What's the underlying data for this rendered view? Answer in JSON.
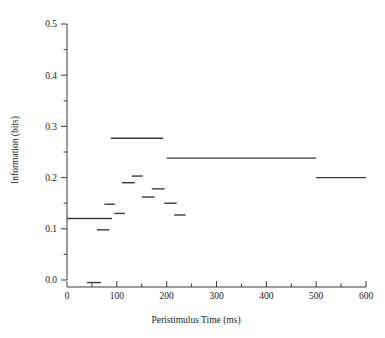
{
  "chart_data": {
    "type": "line",
    "title": "",
    "xlabel": "Peristimulus Time (ms)",
    "ylabel": "Information (bits)",
    "xlim": [
      0,
      600
    ],
    "ylim": [
      0.0,
      0.5
    ],
    "xticks": [
      0,
      100,
      200,
      300,
      400,
      500,
      600
    ],
    "xtick_labels": [
      "0",
      "100",
      "200",
      "300",
      "400",
      "500",
      "600"
    ],
    "xminor_step": 50,
    "yticks": [
      0.0,
      0.1,
      0.2,
      0.3,
      0.4,
      0.5
    ],
    "ytick_labels": [
      "0.0",
      "0.1",
      "0.2",
      "0.3",
      "0.4",
      "0.5"
    ],
    "yminor_step": 0.05,
    "grid": false,
    "legend": null,
    "style": "horizontal-bar-segments",
    "series": [
      {
        "name": "Information",
        "segments": [
          {
            "x_start": 0,
            "x_end": 90,
            "value": 0.12
          },
          {
            "x_start": 40,
            "x_end": 68,
            "value": -0.005
          },
          {
            "x_start": 60,
            "x_end": 85,
            "value": 0.098
          },
          {
            "x_start": 75,
            "x_end": 96,
            "value": 0.148
          },
          {
            "x_start": 88,
            "x_end": 193,
            "value": 0.277
          },
          {
            "x_start": 95,
            "x_end": 116,
            "value": 0.13
          },
          {
            "x_start": 110,
            "x_end": 136,
            "value": 0.19
          },
          {
            "x_start": 130,
            "x_end": 152,
            "value": 0.203
          },
          {
            "x_start": 150,
            "x_end": 176,
            "value": 0.162
          },
          {
            "x_start": 170,
            "x_end": 196,
            "value": 0.178
          },
          {
            "x_start": 195,
            "x_end": 220,
            "value": 0.15
          },
          {
            "x_start": 215,
            "x_end": 238,
            "value": 0.127
          },
          {
            "x_start": 200,
            "x_end": 500,
            "value": 0.238
          },
          {
            "x_start": 500,
            "x_end": 600,
            "value": 0.2
          }
        ]
      }
    ]
  },
  "axis": {
    "x_title": "Peristimulus Time (ms)",
    "y_title": "Information (bits)",
    "x_labels": [
      "0",
      "100",
      "200",
      "300",
      "400",
      "500",
      "600"
    ],
    "y_labels": [
      "0.0",
      "0.1",
      "0.2",
      "0.3",
      "0.4",
      "0.5"
    ],
    "line_color": "#3a3a3a",
    "data_color": "#3a3a3a"
  }
}
